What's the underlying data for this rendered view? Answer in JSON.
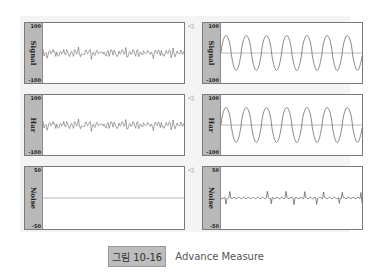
{
  "figure": {
    "badge": "그림 10-16",
    "title": "Advance Measure"
  },
  "panels": [
    {
      "id": "left-signal",
      "label": "Signal",
      "ymax": "100",
      "ymin": "-100",
      "wave": "noise-dense"
    },
    {
      "id": "right-signal",
      "label": "Signal",
      "ymax": "100",
      "ymin": "-100",
      "wave": "sine"
    },
    {
      "id": "left-har",
      "label": "Har",
      "ymax": "100",
      "ymin": "-100",
      "wave": "noise-dense"
    },
    {
      "id": "right-har",
      "label": "Har",
      "ymax": "100",
      "ymin": "-100",
      "wave": "sine"
    },
    {
      "id": "left-noise",
      "label": "Noise",
      "ymax": "50",
      "ymin": "-50",
      "wave": "flat"
    },
    {
      "id": "right-noise",
      "label": "Noise",
      "ymax": "50",
      "ymin": "-50",
      "wave": "spiky"
    }
  ],
  "icons": {
    "speaker": "speaker-icon"
  }
}
